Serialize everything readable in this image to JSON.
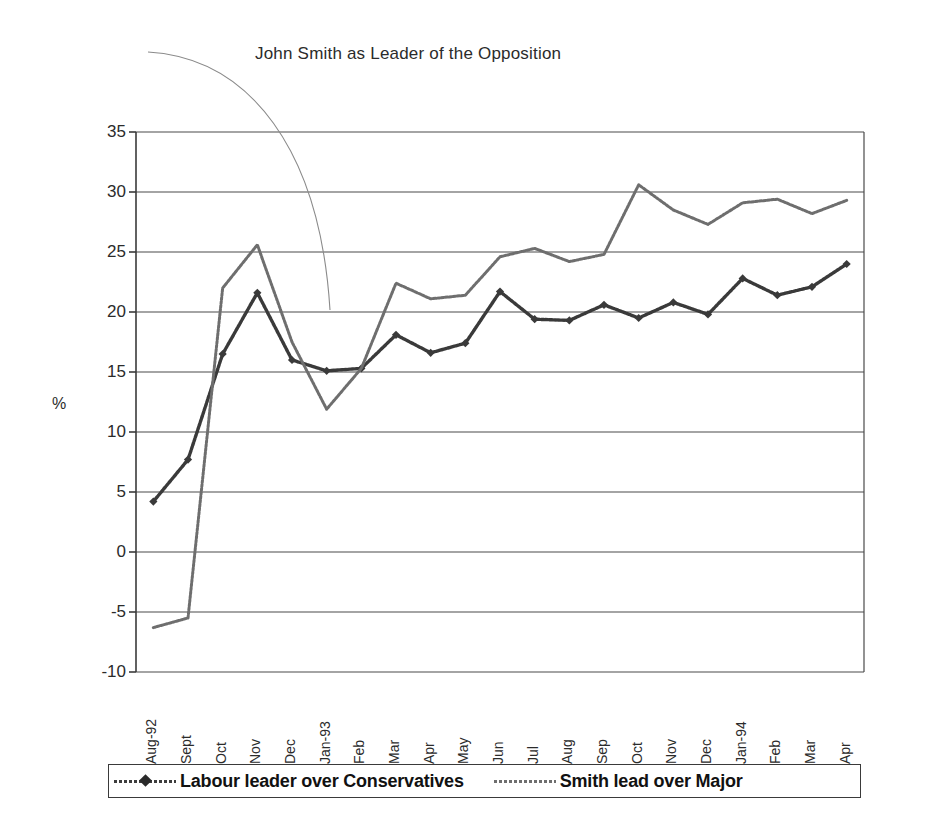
{
  "chart_data": {
    "type": "line",
    "title": "John Smith as Leader of the Opposition",
    "xlabel": "",
    "ylabel": "%",
    "ylim": [
      -10,
      35
    ],
    "ytick_step": 5,
    "yticks": [
      "35",
      "30",
      "25",
      "20",
      "15",
      "10",
      "5",
      "0",
      "-5",
      "-10"
    ],
    "ytick_values": [
      35,
      30,
      25,
      20,
      15,
      10,
      5,
      0,
      -5,
      -10
    ],
    "grid": true,
    "grid_axis": "y",
    "legend_position": "bottom",
    "categories": [
      "Aug-92",
      "Sept",
      "Oct",
      "Nov",
      "Dec",
      "Jan-93",
      "Feb",
      "Mar",
      "Apr",
      "May",
      "Jun",
      "Jul",
      "Aug",
      "Sep",
      "Oct",
      "Nov",
      "Dec",
      "Jan-94",
      "Feb",
      "Mar",
      "Apr"
    ],
    "series": [
      {
        "name": "Labour leader over Conservatives",
        "color": "#3a3a3a",
        "marker": "diamond",
        "values": [
          4.2,
          7.7,
          16.5,
          21.6,
          16.0,
          15.1,
          15.3,
          18.1,
          16.6,
          17.4,
          21.7,
          19.4,
          19.3,
          20.6,
          19.5,
          20.8,
          19.8,
          22.8,
          21.4,
          22.1,
          24.0
        ]
      },
      {
        "name": "Smith lead over Major",
        "color": "#6e6e6e",
        "marker": "none",
        "values": [
          -6.3,
          -5.5,
          22.0,
          25.6,
          17.5,
          11.9,
          15.3,
          22.4,
          21.1,
          21.4,
          24.6,
          25.3,
          24.2,
          24.8,
          30.6,
          28.5,
          27.3,
          29.1,
          29.4,
          28.2,
          29.3
        ]
      }
    ],
    "annotation": {
      "type": "curved-leader-line",
      "label": ""
    }
  },
  "legend": {
    "items": [
      {
        "label": "Labour leader over Conservatives",
        "marker": "dotted-line-with-diamond"
      },
      {
        "label": "Smith lead over Major",
        "marker": "dotted-line"
      }
    ]
  },
  "colors": {
    "series_labour": "#3a3a3a",
    "series_smith": "#6e6e6e",
    "axis": "#3a3a3a",
    "grid": "#4a4a4a",
    "text": "#2b2b2b",
    "background": "#ffffff"
  }
}
